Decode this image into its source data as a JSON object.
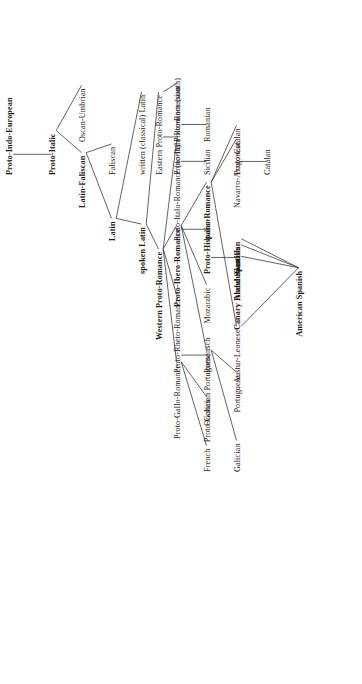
{
  "diagram": {
    "orientation": "rotated-90-counterclockwise",
    "text_color": "#1a1a1a",
    "edge_color": "#3a3a3a",
    "background": "#ffffff"
  },
  "nodes": [
    {
      "id": "pie",
      "label": "Proto-Indo-European",
      "bold": true,
      "depth": 0,
      "track": 0
    },
    {
      "id": "pitalic",
      "label": "Proto-Italic",
      "bold": true,
      "depth": 1,
      "track": 0
    },
    {
      "id": "oscan",
      "label": "Oscan-Umbrian",
      "bold": false,
      "depth": 2,
      "track": -1
    },
    {
      "id": "latfal",
      "label": "Latin-Faliscan",
      "bold": true,
      "depth": 2,
      "track": 1
    },
    {
      "id": "faliscan",
      "label": "Faliscan",
      "bold": false,
      "depth": 3,
      "track": 0
    },
    {
      "id": "latin",
      "label": "Latin",
      "bold": true,
      "depth": 3,
      "track": 2
    },
    {
      "id": "wclatin",
      "label": "written (classical) Latin",
      "bold": false,
      "depth": 4,
      "track": 0
    },
    {
      "id": "splatin",
      "label": "spoken Latin",
      "bold": true,
      "depth": 4,
      "track": 3
    },
    {
      "id": "eastpr",
      "label": "Eastern Proto-Romance",
      "bold": false,
      "depth": 5,
      "track": 0
    },
    {
      "id": "westpr",
      "label": "Western Proto-Romance",
      "bold": true,
      "depth": 5,
      "track": 5
    },
    {
      "id": "pirnorth",
      "label": "Proto-Italo-Romance (north)",
      "bold": false,
      "depth": 6,
      "track": 2
    },
    {
      "id": "pirsouth",
      "label": "Proto-Italo-Romance (south)",
      "bold": false,
      "depth": 6,
      "track": 0
    },
    {
      "id": "promanian",
      "label": "Proto-Romanian",
      "bold": false,
      "depth": 6,
      "track": -1
    },
    {
      "id": "italian",
      "label": "Italian",
      "bold": false,
      "depth": 7,
      "track": 2
    },
    {
      "id": "sicilian",
      "label": "Sicilian",
      "bold": false,
      "depth": 7,
      "track": 0
    },
    {
      "id": "romanian",
      "label": "Romanian",
      "bold": false,
      "depth": 7,
      "track": -1
    },
    {
      "id": "prheto",
      "label": "Proto-Rheto-Romance",
      "bold": false,
      "depth": 6,
      "track": 6
    },
    {
      "id": "romansch",
      "label": "Romansch",
      "bold": false,
      "depth": 7,
      "track": 6
    },
    {
      "id": "pgallo",
      "label": "Proto-Gallo-Romance",
      "bold": false,
      "depth": 6,
      "track": 8
    },
    {
      "id": "occitan",
      "label": "Occitan",
      "bold": false,
      "depth": 7,
      "track": 7.6
    },
    {
      "id": "french",
      "label": "French",
      "bold": false,
      "depth": 7,
      "track": 9
    },
    {
      "id": "pibero",
      "label": "Proto-Ibero-Romance",
      "bold": true,
      "depth": 6,
      "track": 4
    },
    {
      "id": "mozarabic",
      "label": "Mozarabic",
      "bold": false,
      "depth": 7,
      "track": 4.5
    },
    {
      "id": "pgalpor",
      "label": "Proto-Galician Portuguese",
      "bold": false,
      "depth": 7,
      "track": 8.1
    },
    {
      "id": "portug",
      "label": "Portuguese",
      "bold": false,
      "depth": 8,
      "track": 7.2
    },
    {
      "id": "galician",
      "label": "Galician",
      "bold": false,
      "depth": 8,
      "track": 9
    },
    {
      "id": "phispano",
      "label": "Proto-Hispano-Romance",
      "bold": true,
      "depth": 7,
      "track": 3
    },
    {
      "id": "pcatalan",
      "label": "Proto-Catalan",
      "bold": false,
      "depth": 8,
      "track": 0
    },
    {
      "id": "catalan",
      "label": "Catalan",
      "bold": false,
      "depth": 9,
      "track": 0
    },
    {
      "id": "navarro",
      "label": "Navarro-Aragonese",
      "bold": false,
      "depth": 8,
      "track": 1
    },
    {
      "id": "castilian",
      "label": "Castilian",
      "bold": true,
      "depth": 8,
      "track": 3
    },
    {
      "id": "andalusian",
      "label": "Andalusian",
      "bold": true,
      "depth": 8,
      "track": 3.8
    },
    {
      "id": "canary",
      "label": "Canary Island Spanish",
      "bold": true,
      "depth": 8,
      "track": 4.7
    },
    {
      "id": "austur",
      "label": "Austur-Leonese",
      "bold": false,
      "depth": 8,
      "track": 6.3
    },
    {
      "id": "amspanish",
      "label": "American Spanish",
      "bold": true,
      "depth": 10,
      "track": 4.9
    }
  ],
  "edges": [
    {
      "from": "pie",
      "to": "pitalic"
    },
    {
      "from": "pitalic",
      "to": "oscan"
    },
    {
      "from": "pitalic",
      "to": "latfal"
    },
    {
      "from": "latfal",
      "to": "faliscan"
    },
    {
      "from": "latfal",
      "to": "latin"
    },
    {
      "from": "latin",
      "to": "wclatin"
    },
    {
      "from": "latin",
      "to": "splatin"
    },
    {
      "from": "splatin",
      "to": "eastpr"
    },
    {
      "from": "splatin",
      "to": "westpr"
    },
    {
      "from": "eastpr",
      "to": "pirsouth"
    },
    {
      "from": "eastpr",
      "to": "promanian"
    },
    {
      "from": "pirsouth",
      "to": "sicilian"
    },
    {
      "from": "promanian",
      "to": "romanian"
    },
    {
      "from": "westpr",
      "to": "pirnorth"
    },
    {
      "from": "pirnorth",
      "to": "italian"
    },
    {
      "from": "westpr",
      "to": "prheto"
    },
    {
      "from": "prheto",
      "to": "romansch"
    },
    {
      "from": "westpr",
      "to": "pgallo"
    },
    {
      "from": "pgallo",
      "to": "occitan"
    },
    {
      "from": "pgallo",
      "to": "french"
    },
    {
      "from": "westpr",
      "to": "pibero"
    },
    {
      "from": "pibero",
      "to": "mozarabic"
    },
    {
      "from": "pibero",
      "to": "pgalpor"
    },
    {
      "from": "pgalpor",
      "to": "portug"
    },
    {
      "from": "pgalpor",
      "to": "galician"
    },
    {
      "from": "pibero",
      "to": "phispano"
    },
    {
      "from": "phispano",
      "to": "pcatalan"
    },
    {
      "from": "pcatalan",
      "to": "catalan"
    },
    {
      "from": "phispano",
      "to": "navarro"
    },
    {
      "from": "phispano",
      "to": "castilian"
    },
    {
      "from": "phispano",
      "to": "austur"
    },
    {
      "from": "castilian",
      "to": "amspanish"
    },
    {
      "from": "andalusian",
      "to": "amspanish"
    },
    {
      "from": "canary",
      "to": "amspanish"
    },
    {
      "from": "austur",
      "to": "amspanish"
    }
  ],
  "layout": {
    "depth_x": [
      10,
      53,
      83,
      113,
      143,
      160,
      178,
      208,
      238,
      268,
      300
    ],
    "track_y": [
      175,
      205,
      253,
      286,
      320,
      352,
      385,
      420,
      455,
      490,
      520
    ],
    "label_offset": 3
  }
}
